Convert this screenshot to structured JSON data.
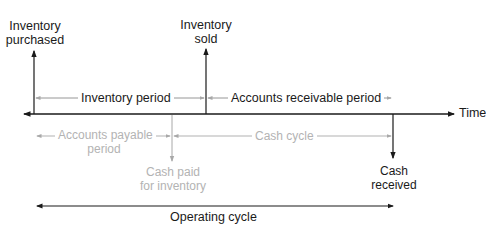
{
  "diagram": {
    "axis": {
      "label": "Time"
    },
    "events": {
      "inventory_purchased": {
        "line1": "Inventory",
        "line2": "purchased"
      },
      "inventory_sold": {
        "line1": "Inventory",
        "line2": "sold"
      },
      "cash_paid": {
        "line1": "Cash paid",
        "line2": "for inventory"
      },
      "cash_received": {
        "line1": "Cash",
        "line2": "received"
      }
    },
    "periods": {
      "inventory_period": "Inventory period",
      "accounts_receivable_period": "Accounts receivable period",
      "accounts_payable_period": {
        "line1": "Accounts payable",
        "line2": "period"
      },
      "cash_cycle": "Cash cycle",
      "operating_cycle": "Operating cycle"
    },
    "colors": {
      "primary": "#1a1a1a",
      "secondary": "#b3b3b3"
    }
  }
}
